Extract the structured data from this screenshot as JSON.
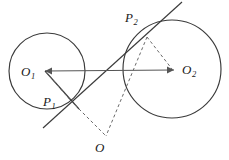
{
  "figure": {
    "type": "geometry-diagram",
    "background_color": "#ffffff",
    "stroke_color": "#3a3a3a",
    "label_color": "#1a1a1a"
  },
  "labels": {
    "center_left": {
      "base": "O",
      "sub": "1"
    },
    "center_right": {
      "base": "O",
      "sub": "2"
    },
    "tangent_point_left": {
      "base": "P",
      "sub": "1"
    },
    "tangent_point_right": {
      "base": "P",
      "sub": "2"
    },
    "intersection_point": {
      "base": "O",
      "sub": ""
    }
  },
  "geometry": {
    "circles": [
      {
        "name": "circle-o1",
        "cx": 47,
        "cy": 71,
        "r": 38
      },
      {
        "name": "circle-o2",
        "cx": 172,
        "cy": 69,
        "r": 49
      }
    ],
    "points": {
      "O1": {
        "x": 47,
        "y": 71
      },
      "O2": {
        "x": 172,
        "y": 69
      },
      "P1": {
        "x": 71,
        "y": 101
      },
      "P2": {
        "x": 147,
        "y": 37
      },
      "O": {
        "x": 106,
        "y": 136
      }
    },
    "solid_lines": [
      {
        "name": "center-line-o1-o2",
        "x1": 45,
        "y1": 71,
        "x2": 174,
        "y2": 70
      },
      {
        "name": "tangent-line",
        "x1": 43,
        "y1": 128,
        "x2": 182,
        "y2": 2
      },
      {
        "name": "radius-o1-p1-extension",
        "x1": 45,
        "y1": 71,
        "x2": 79,
        "y2": 109
      }
    ],
    "dashed_lines": [
      {
        "name": "dashed-o1-p1",
        "x1": 46,
        "y1": 72,
        "x2": 71,
        "y2": 101
      },
      {
        "name": "dashed-p1-o",
        "x1": 71,
        "y1": 101,
        "x2": 106,
        "y2": 136
      },
      {
        "name": "dashed-p2-o2",
        "x1": 147,
        "y1": 37,
        "x2": 172,
        "y2": 69
      },
      {
        "name": "dashed-p2-o",
        "x1": 147,
        "y1": 37,
        "x2": 106,
        "y2": 136
      }
    ],
    "arrow_markers": [
      {
        "name": "arrowhead-toward-o2",
        "x": 174,
        "y": 70
      },
      {
        "name": "arrowhead-toward-o1",
        "x": 45,
        "y": 71
      }
    ]
  }
}
